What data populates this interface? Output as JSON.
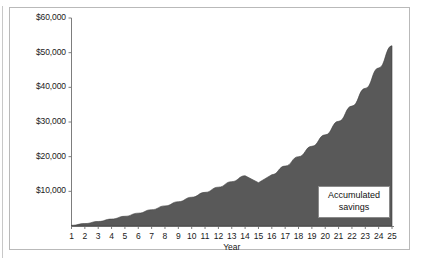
{
  "chart_data": {
    "type": "area",
    "title": "",
    "xlabel": "Year",
    "ylabel": "",
    "grid": false,
    "legend_position": "none",
    "series_fill_color": "#595959",
    "xlim": [
      1,
      25
    ],
    "ylim": [
      0,
      60000
    ],
    "x": [
      1,
      2,
      3,
      4,
      5,
      6,
      7,
      8,
      9,
      10,
      11,
      12,
      13,
      14,
      15,
      16,
      17,
      18,
      19,
      20,
      21,
      22,
      23,
      24,
      25
    ],
    "categories": [
      "1",
      "2",
      "3",
      "4",
      "5",
      "6",
      "7",
      "8",
      "9",
      "10",
      "11",
      "12",
      "13",
      "14",
      "15",
      "16",
      "17",
      "18",
      "19",
      "20",
      "21",
      "22",
      "23",
      "24",
      "25"
    ],
    "series": [
      {
        "name": "Accumulated savings",
        "values": [
          200,
          700,
          1300,
          2000,
          2800,
          3700,
          4700,
          5800,
          7000,
          8300,
          9700,
          11200,
          12800,
          14500,
          12500,
          14800,
          17300,
          20000,
          23000,
          26300,
          30200,
          34600,
          39700,
          45600,
          52000
        ]
      }
    ],
    "ytick_labels": [
      "$60,000",
      "$50,000",
      "$40,000",
      "$30,000",
      "$20,000",
      "$10,000"
    ],
    "ytick_values": [
      60000,
      50000,
      40000,
      30000,
      20000,
      10000
    ],
    "xtick_labels": [
      "1",
      "2",
      "3",
      "4",
      "5",
      "6",
      "7",
      "8",
      "9",
      "10",
      "11",
      "12",
      "13",
      "14",
      "15",
      "16",
      "17",
      "18",
      "19",
      "20",
      "21",
      "22",
      "23",
      "24",
      "25"
    ],
    "annotations": [
      {
        "name": "accumulated-savings-callout",
        "line1": "Accumulated",
        "line2": "savings"
      }
    ]
  }
}
